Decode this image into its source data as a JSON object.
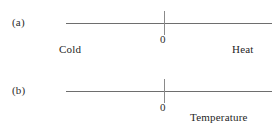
{
  "figure": {
    "background_color": "#ffffff",
    "line_color": "#6e6e6e",
    "tick_color": "#8a8a8a",
    "text_color": "#262626"
  },
  "panels": [
    {
      "id": "a",
      "label": "(a)",
      "zero_label": "0",
      "left_label": "Cold",
      "right_label": "Heat"
    },
    {
      "id": "b",
      "label": "(b)",
      "zero_label": "0",
      "axis_label": "Temperature"
    }
  ],
  "chart_data": {
    "type": "line",
    "title": "",
    "subtitle": "",
    "xlabel": "Temperature",
    "ylabel": "",
    "grid": false,
    "legend": "none",
    "panels": [
      {
        "name": "(a)",
        "axis_type": "number-line",
        "ticks": [
          {
            "x": 0,
            "label": "0"
          }
        ],
        "annotations": [
          {
            "text": "Cold",
            "position": "left-below-axis"
          },
          {
            "text": "Heat",
            "position": "right-below-axis"
          }
        ],
        "axis_extent": "line spans full panel width with origin tick near centre",
        "xlim": [
          -1,
          1
        ]
      },
      {
        "name": "(b)",
        "axis_type": "number-line",
        "ticks": [
          {
            "x": 0,
            "label": "0"
          }
        ],
        "annotations": [
          {
            "text": "Temperature",
            "position": "right-of-origin-below-axis"
          }
        ],
        "axis_extent": "line spans full panel width with origin tick near centre",
        "xlim": [
          -1,
          1
        ]
      }
    ]
  }
}
